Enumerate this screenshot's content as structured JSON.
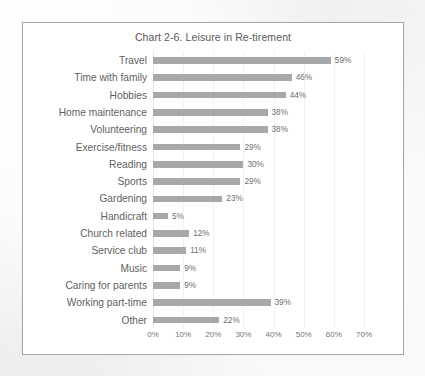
{
  "chart_data": {
    "type": "bar",
    "orientation": "horizontal",
    "title": "Chart 2-6. Leisure in Re-tirement",
    "xlabel": "",
    "ylabel": "",
    "xlim": [
      0,
      70
    ],
    "grid": true,
    "legend": "none",
    "value_suffix": "%",
    "xticks": [
      "0%",
      "10%",
      "20%",
      "30%",
      "40%",
      "50%",
      "60%",
      "70%"
    ],
    "xtick_values": [
      0,
      10,
      20,
      30,
      40,
      50,
      60,
      70
    ],
    "categories": [
      "Travel",
      "Time with family",
      "Hobbies",
      "Home maintenance",
      "Volunteering",
      "Exercise/fitness",
      "Reading",
      "Sports",
      "Gardening",
      "Handicraft",
      "Church related",
      "Service club",
      "Music",
      "Caring for parents",
      "Working part-time",
      "Other"
    ],
    "values": [
      59,
      46,
      44,
      38,
      38,
      29,
      30,
      29,
      23,
      5,
      12,
      11,
      9,
      9,
      39,
      22
    ],
    "data_labels": [
      "59%",
      "46%",
      "44%",
      "38%",
      "38%",
      "29%",
      "30%",
      "29%",
      "23%",
      "5%",
      "12%",
      "11%",
      "9%",
      "9%",
      "39%",
      "22%"
    ],
    "colors": {
      "bar": "#a8a8a8",
      "gridline": "#f1f1f1",
      "axis_text": "#757575",
      "label_text": "#5f5f5f",
      "title_text": "#595959",
      "plot_background": "#ffffff",
      "frame_border": "#a9a9a9",
      "page_background": "#f2f2f2"
    }
  }
}
